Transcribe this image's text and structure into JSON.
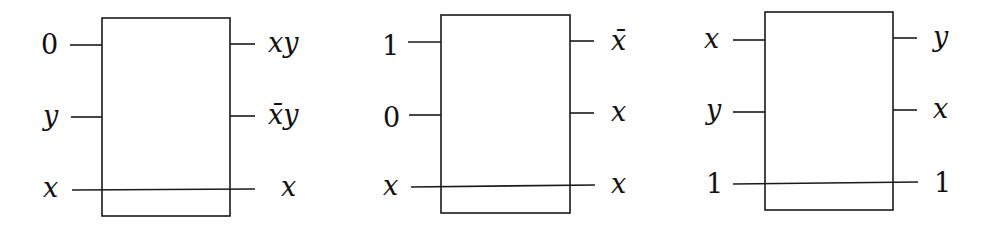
{
  "gates": [
    {
      "box": {
        "x": 102,
        "y": 18,
        "w": 128,
        "h": 198
      },
      "inputs": [
        {
          "label": "0",
          "italic": false,
          "y": 45
        },
        {
          "label": "y",
          "italic": true,
          "y": 117
        },
        {
          "label": "x",
          "italic": true,
          "y": 190
        }
      ],
      "outputs": [
        {
          "label": "xy",
          "italic": true,
          "y": 44
        },
        {
          "label": "x̄y",
          "italic": true,
          "y": 116
        },
        {
          "label": "x",
          "italic": true,
          "y": 189
        }
      ]
    },
    {
      "box": {
        "x": 441,
        "y": 15,
        "w": 129,
        "h": 198
      },
      "inputs": [
        {
          "label": "1",
          "italic": false,
          "y": 42
        },
        {
          "label": "0",
          "italic": false,
          "y": 115
        },
        {
          "label": "x",
          "italic": true,
          "y": 187
        }
      ],
      "outputs": [
        {
          "label": "x̄",
          "italic": true,
          "y": 41
        },
        {
          "label": "x",
          "italic": true,
          "y": 113
        },
        {
          "label": "x",
          "italic": true,
          "y": 185
        }
      ]
    },
    {
      "box": {
        "x": 765,
        "y": 12,
        "w": 128,
        "h": 198
      },
      "inputs": [
        {
          "label": "x",
          "italic": true,
          "y": 40
        },
        {
          "label": "y",
          "italic": true,
          "y": 112
        },
        {
          "label": "1",
          "italic": false,
          "y": 183
        }
      ],
      "outputs": [
        {
          "label": "y",
          "italic": true,
          "y": 38
        },
        {
          "label": "x",
          "italic": true,
          "y": 110
        },
        {
          "label": "1",
          "italic": false,
          "y": 182
        }
      ]
    }
  ]
}
